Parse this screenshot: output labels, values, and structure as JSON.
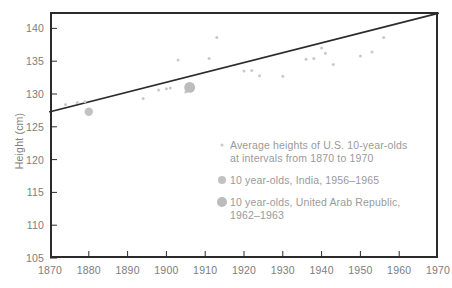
{
  "chart_data": {
    "type": "scatter",
    "title": "",
    "xlabel": "",
    "ylabel": "Height (cm)",
    "xlim": [
      1870,
      1970
    ],
    "ylim": [
      105,
      142.5
    ],
    "grid": false,
    "legend_position": "inside-lower-right",
    "xticks": [
      1870,
      1880,
      1890,
      1900,
      1910,
      1920,
      1930,
      1940,
      1950,
      1960,
      1970
    ],
    "yticks": [
      105,
      110,
      115,
      120,
      125,
      130,
      135,
      140
    ],
    "series": [
      {
        "name": "Average heights of U.S. 10-year-olds at intervals from 1870 to 1970",
        "marker": "small-dot",
        "color": "#c9c9c9",
        "points": [
          {
            "x": 1874,
            "y": 128.4
          },
          {
            "x": 1877,
            "y": 128.7
          },
          {
            "x": 1879,
            "y": 128.8
          },
          {
            "x": 1894,
            "y": 129.3
          },
          {
            "x": 1898,
            "y": 130.6
          },
          {
            "x": 1900,
            "y": 130.8
          },
          {
            "x": 1901,
            "y": 130.9
          },
          {
            "x": 1903,
            "y": 135.2
          },
          {
            "x": 1905,
            "y": 130.3
          },
          {
            "x": 1911,
            "y": 135.4
          },
          {
            "x": 1913,
            "y": 138.6
          },
          {
            "x": 1920,
            "y": 133.5
          },
          {
            "x": 1922,
            "y": 133.6
          },
          {
            "x": 1924,
            "y": 132.8
          },
          {
            "x": 1930,
            "y": 132.7
          },
          {
            "x": 1936,
            "y": 135.3
          },
          {
            "x": 1938,
            "y": 135.4
          },
          {
            "x": 1940,
            "y": 137.0
          },
          {
            "x": 1941,
            "y": 136.2
          },
          {
            "x": 1943,
            "y": 134.5
          },
          {
            "x": 1950,
            "y": 135.8
          },
          {
            "x": 1953,
            "y": 136.4
          },
          {
            "x": 1956,
            "y": 138.6
          }
        ]
      },
      {
        "name": "10 year-olds, India, 1956–1965",
        "marker": "medium-circle",
        "color": "#c2c2c2",
        "points": [
          {
            "x": 1880,
            "y": 127.3
          }
        ]
      },
      {
        "name": "10 year-olds, United Arab Republic, 1962–1963",
        "marker": "large-circle",
        "color": "#bcbcbc",
        "points": [
          {
            "x": 1906,
            "y": 131.0
          }
        ]
      }
    ],
    "trend_line": {
      "name": "fitted trend line",
      "color": "#2b2b2b",
      "from": {
        "x": 1870,
        "y": 127.3
      },
      "to": {
        "x": 1970,
        "y": 142.3
      }
    }
  },
  "axes": {
    "y_title": "Height (cm)",
    "y_tick_labels": [
      "140",
      "135",
      "130",
      "125",
      "120",
      "115",
      "110",
      "105"
    ],
    "x_tick_labels": [
      "1870",
      "1880",
      "1890",
      "1900",
      "1910",
      "1920",
      "1930",
      "1940",
      "1950",
      "1960",
      "1970"
    ]
  },
  "legend": {
    "items": [
      {
        "marker": "small-dot-marker",
        "label": "Average heights of U.S. 10-year-olds\nat intervals from 1870 to 1970"
      },
      {
        "marker": "medium-circle-marker",
        "label": "10 year-olds, India, 1956–1965"
      },
      {
        "marker": "large-circle-marker",
        "label": "10 year-olds, United Arab Republic,\n1962–1963"
      }
    ]
  },
  "colors": {
    "frame": "#2b2b2b",
    "trend": "#2b2b2b",
    "tick_text": "#7d7d7d",
    "legend_text": "#9a9a9a",
    "marker_small": "#c9c9c9",
    "marker_mid": "#c2c2c2",
    "marker_large": "#bcbcbc",
    "background": "#ffffff"
  }
}
